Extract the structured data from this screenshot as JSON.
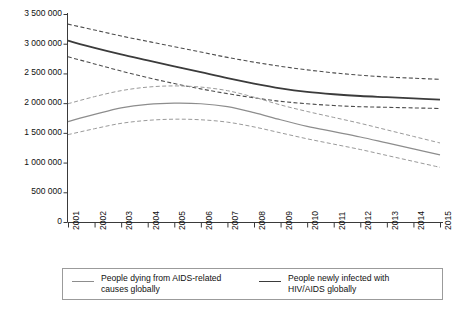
{
  "chart_data": {
    "type": "line",
    "title": "",
    "xlabel": "",
    "ylabel": "",
    "grid": false,
    "legend_position": "bottom",
    "x": [
      2001,
      2002,
      2003,
      2004,
      2005,
      2006,
      2007,
      2008,
      2009,
      2010,
      2011,
      2012,
      2013,
      2014,
      2015
    ],
    "categories": [
      "2001",
      "2002",
      "2003",
      "2004",
      "2005",
      "2006",
      "2007",
      "2008",
      "2009",
      "2010",
      "2011",
      "2012",
      "2013",
      "2014",
      "2015"
    ],
    "ylim": [
      0,
      3500000
    ],
    "ytick_values": [
      0,
      500000,
      1000000,
      1500000,
      2000000,
      2500000,
      3000000,
      3500000
    ],
    "ytick_labels": [
      "0",
      "500 000",
      "1 000 000",
      "1 500 000",
      "2 000 000",
      "2 500 000",
      "3 000 000",
      "3 500 000"
    ],
    "series": [
      {
        "name": "People newly infected with HIV/AIDS globally",
        "style": "solid",
        "color": "#3b3b3b",
        "width": 1.8,
        "values": [
          3050000,
          2930000,
          2820000,
          2720000,
          2620000,
          2520000,
          2420000,
          2330000,
          2250000,
          2190000,
          2150000,
          2120000,
          2100000,
          2080000,
          2060000
        ]
      },
      {
        "name": "People newly infected with HIV/AIDS globally — upper bound",
        "style": "dashed",
        "color": "#4d4d4d",
        "width": 1.1,
        "values": [
          3330000,
          3230000,
          3130000,
          3040000,
          2950000,
          2860000,
          2770000,
          2690000,
          2620000,
          2560000,
          2510000,
          2470000,
          2440000,
          2420000,
          2400000
        ]
      },
      {
        "name": "People newly infected with HIV/AIDS globally — lower bound",
        "style": "dashed",
        "color": "#4d4d4d",
        "width": 1.1,
        "values": [
          2780000,
          2660000,
          2540000,
          2430000,
          2330000,
          2240000,
          2160000,
          2090000,
          2030000,
          1990000,
          1960000,
          1940000,
          1930000,
          1920000,
          1910000
        ]
      },
      {
        "name": "People dying from AIDS-related causes globally",
        "style": "solid",
        "color": "#8d8d8d",
        "width": 1.2,
        "values": [
          1690000,
          1810000,
          1920000,
          1980000,
          2000000,
          1990000,
          1940000,
          1840000,
          1720000,
          1610000,
          1520000,
          1430000,
          1330000,
          1230000,
          1130000
        ]
      },
      {
        "name": "People dying from AIDS-related causes globally — upper bound",
        "style": "dashed",
        "color": "#9a9a9a",
        "width": 1.0,
        "values": [
          1990000,
          2110000,
          2210000,
          2270000,
          2290000,
          2270000,
          2210000,
          2100000,
          1970000,
          1860000,
          1760000,
          1660000,
          1550000,
          1440000,
          1330000
        ]
      },
      {
        "name": "People dying from AIDS-related causes globally — lower bound",
        "style": "dashed",
        "color": "#9a9a9a",
        "width": 1.0,
        "values": [
          1470000,
          1570000,
          1660000,
          1710000,
          1730000,
          1720000,
          1680000,
          1600000,
          1500000,
          1400000,
          1310000,
          1220000,
          1120000,
          1020000,
          920000
        ]
      }
    ],
    "legend": [
      {
        "label_line1": "People dying from AIDS-related",
        "label_line2": "causes globally",
        "swatch": "deaths"
      },
      {
        "label_line1": "People newly infected with",
        "label_line2": "HIV/AIDS globally",
        "swatch": "infections"
      }
    ],
    "axis_color": "#3a3a3a"
  }
}
